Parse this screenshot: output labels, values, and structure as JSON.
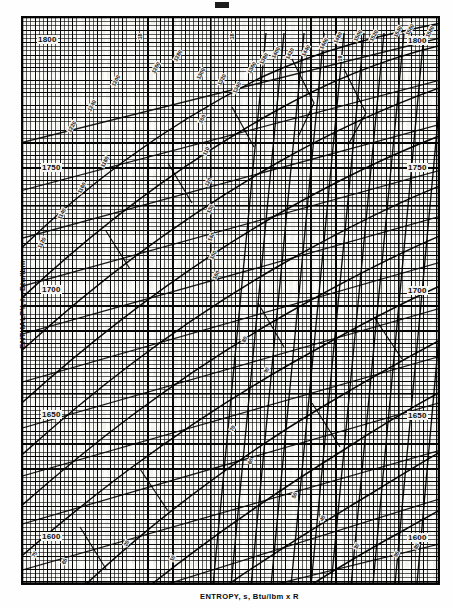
{
  "figure": {
    "kind": "mollier-diagram",
    "top_mark": "page-artifact"
  },
  "axes": {
    "y_title": "ENTHALPY, h, Btu/lbm",
    "x_title": "ENTROPY, s, Btu/lbm x R",
    "y_ticks_left": [
      "1800",
      "1750",
      "1700",
      "1650",
      "1600"
    ],
    "y_ticks_right": [
      "1800",
      "1750",
      "1700",
      "1650",
      "1600"
    ]
  },
  "chart_data": {
    "type": "line",
    "title": "",
    "xlabel": "ENTROPY, s, Btu/lbm x R",
    "ylabel": "ENTHALPY, h, Btu/lbm",
    "grid": true,
    "legend": "none",
    "ylim": [
      1580,
      1815
    ],
    "ytick_values": [
      1800,
      1750,
      1700,
      1650,
      1600
    ],
    "left_labels": [
      {
        "text": "1800",
        "x": 38,
        "y": 40
      },
      {
        "text": "1750",
        "x": 42,
        "y": 168
      },
      {
        "text": "1700",
        "x": 42,
        "y": 290
      },
      {
        "text": "1650",
        "x": 42,
        "y": 415
      },
      {
        "text": "1600",
        "x": 42,
        "y": 537
      }
    ],
    "right_labels": [
      {
        "text": "1800",
        "x": 408,
        "y": 41
      },
      {
        "text": "1750",
        "x": 408,
        "y": 168
      },
      {
        "text": "1700",
        "x": 408,
        "y": 291
      },
      {
        "text": "1650",
        "x": 408,
        "y": 416
      },
      {
        "text": "1600",
        "x": 408,
        "y": 538
      }
    ],
    "curve_labels": [
      {
        "text": "1200",
        "x": 110,
        "y": 85,
        "rot": -62
      },
      {
        "text": "1220",
        "x": 66,
        "y": 131,
        "rot": -62
      },
      {
        "text": "1240",
        "x": 86,
        "y": 110,
        "rot": -62
      },
      {
        "text": "1260",
        "x": 150,
        "y": 72,
        "rot": -62
      },
      {
        "text": "1280",
        "x": 172,
        "y": 60,
        "rot": -62
      },
      {
        "text": "1300",
        "x": 195,
        "y": 78,
        "rot": -62
      },
      {
        "text": "1320",
        "x": 216,
        "y": 84,
        "rot": -62
      },
      {
        "text": "1340",
        "x": 231,
        "y": 92,
        "rot": -62
      },
      {
        "text": "1360",
        "x": 246,
        "y": 72,
        "rot": -62
      },
      {
        "text": "1380",
        "x": 258,
        "y": 63,
        "rot": -62
      },
      {
        "text": "1400",
        "x": 270,
        "y": 57,
        "rot": -62
      },
      {
        "text": "1420",
        "x": 284,
        "y": 58,
        "rot": -62
      },
      {
        "text": "1440",
        "x": 300,
        "y": 55,
        "rot": -62
      },
      {
        "text": "1460",
        "x": 318,
        "y": 48,
        "rot": -62
      },
      {
        "text": "1480",
        "x": 332,
        "y": 42,
        "rot": -62
      },
      {
        "text": "1500",
        "x": 352,
        "y": 40,
        "rot": -62
      },
      {
        "text": "1520",
        "x": 368,
        "y": 40,
        "rot": -62
      },
      {
        "text": "1540",
        "x": 392,
        "y": 36,
        "rot": -62
      },
      {
        "text": "1560",
        "x": 404,
        "y": 34,
        "rot": -62
      },
      {
        "text": "1580",
        "x": 424,
        "y": 36,
        "rot": -62
      },
      {
        "text": "18",
        "x": 137,
        "y": 40,
        "rot": -90
      },
      {
        "text": "18",
        "x": 229,
        "y": 40,
        "rot": -90
      },
      {
        "text": "19",
        "x": 337,
        "y": 62,
        "rot": -90
      },
      {
        "text": "100",
        "x": 197,
        "y": 122,
        "rot": -62
      },
      {
        "text": "110",
        "x": 201,
        "y": 154,
        "rot": -62
      },
      {
        "text": "120",
        "x": 203,
        "y": 185,
        "rot": -62
      },
      {
        "text": "130",
        "x": 205,
        "y": 212,
        "rot": -62
      },
      {
        "text": "140",
        "x": 206,
        "y": 240,
        "rot": -62
      },
      {
        "text": "150",
        "x": 208,
        "y": 258,
        "rot": -62
      },
      {
        "text": "160",
        "x": 211,
        "y": 278,
        "rot": -62
      },
      {
        "text": "1180",
        "x": 99,
        "y": 166,
        "rot": -62
      },
      {
        "text": "1160",
        "x": 76,
        "y": 192,
        "rot": -62
      },
      {
        "text": "1140",
        "x": 56,
        "y": 218,
        "rot": -62
      },
      {
        "text": "1120",
        "x": 36,
        "y": 247,
        "rot": -62
      },
      {
        "text": "80",
        "x": 240,
        "y": 341,
        "rot": -62
      },
      {
        "text": "90",
        "x": 262,
        "y": 372,
        "rot": -62
      },
      {
        "text": "70",
        "x": 228,
        "y": 430,
        "rot": -62
      },
      {
        "text": "60",
        "x": 246,
        "y": 463,
        "rot": -62
      },
      {
        "text": "50",
        "x": 290,
        "y": 497,
        "rot": -62
      },
      {
        "text": "40",
        "x": 318,
        "y": 520,
        "rot": -62
      },
      {
        "text": "30",
        "x": 352,
        "y": 548,
        "rot": -62
      },
      {
        "text": "20",
        "x": 122,
        "y": 545,
        "rot": -62
      },
      {
        "text": "10",
        "x": 168,
        "y": 560,
        "rot": -62
      },
      {
        "text": "95",
        "x": 392,
        "y": 556,
        "rot": -62
      },
      {
        "text": "85",
        "x": 412,
        "y": 548,
        "rot": -62
      },
      {
        "text": "75",
        "x": 30,
        "y": 556,
        "rot": -62
      },
      {
        "text": "65",
        "x": 60,
        "y": 563,
        "rot": -62
      }
    ],
    "series_families": [
      {
        "name": "constant-pressure",
        "count": 22,
        "orientation": "rising-right"
      },
      {
        "name": "constant-temperature",
        "count": 18,
        "orientation": "shallow-rising"
      },
      {
        "name": "constant-quality",
        "count": 12,
        "orientation": "steep"
      }
    ]
  }
}
